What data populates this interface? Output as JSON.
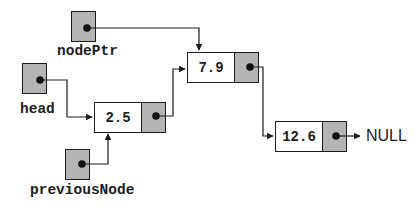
{
  "diagram": {
    "external_pointers": [
      {
        "id": "nodePtr",
        "label": "nodePtr"
      },
      {
        "id": "head",
        "label": "head"
      },
      {
        "id": "previousNode",
        "label": "previousNode"
      }
    ],
    "nodes": [
      {
        "id": "node-1",
        "value": "2.5"
      },
      {
        "id": "node-2",
        "value": "7.9"
      },
      {
        "id": "node-3",
        "value": "12.6"
      }
    ],
    "terminator": "NULL",
    "edges": [
      {
        "from": "nodePtr",
        "to": "node 7.9"
      },
      {
        "from": "head",
        "to": "node 2.5"
      },
      {
        "from": "previousNode",
        "to": "node 2.5"
      },
      {
        "from": "node 2.5",
        "to": "node 7.9"
      },
      {
        "from": "node 7.9",
        "to": "node 12.6"
      },
      {
        "from": "node 12.6",
        "to": "NULL"
      }
    ],
    "colors": {
      "pointer_box_fill": "#b4b4b4",
      "node_value_fill": "#ffffff",
      "line": "#1c1c1c",
      "background": "#ffffff"
    }
  }
}
